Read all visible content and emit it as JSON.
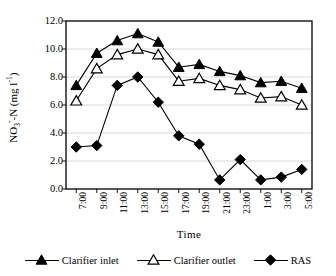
{
  "chart_data": {
    "type": "line",
    "title": "",
    "xlabel": "Time",
    "ylabel": "NO3--N (mg l-1)",
    "ylabel_parts": {
      "prefix": "NO",
      "sub": "3",
      "sup_minus": "-",
      "mid": "-N (mg l",
      "sup": "-1",
      "suffix": ")"
    },
    "categories": [
      "7:00",
      "9:00",
      "11:00",
      "13:00",
      "15:00",
      "17:00",
      "19:00",
      "21:00",
      "23:00",
      "1:00",
      "3:00",
      "5:00"
    ],
    "ylim": [
      0.0,
      12.0
    ],
    "yticks": [
      "12.0",
      "10.0",
      "8.0",
      "6.0",
      "4.0",
      "2.0",
      "0.0"
    ],
    "ytick_values": [
      12.0,
      10.0,
      8.0,
      6.0,
      4.0,
      2.0,
      0.0
    ],
    "grid": "horizontal",
    "legend_position": "bottom",
    "series": [
      {
        "name": "Clarifier inlet",
        "marker": "filled-triangle",
        "color": "#000000",
        "values": [
          7.4,
          9.7,
          10.6,
          11.1,
          10.5,
          8.7,
          8.9,
          8.4,
          8.1,
          7.6,
          7.7,
          7.2
        ]
      },
      {
        "name": "Clarifier outlet",
        "marker": "open-triangle",
        "color": "#000000",
        "values": [
          6.3,
          8.6,
          9.6,
          10.0,
          9.6,
          7.7,
          7.9,
          7.4,
          7.1,
          6.5,
          6.6,
          6.0
        ]
      },
      {
        "name": "RAS",
        "marker": "filled-diamond",
        "color": "#000000",
        "values": [
          3.0,
          3.1,
          7.4,
          8.0,
          6.2,
          3.8,
          3.2,
          0.65,
          2.1,
          0.65,
          0.85,
          1.4
        ]
      }
    ]
  },
  "legend": {
    "items": [
      {
        "label": "Clarifier inlet",
        "marker": "filled-triangle"
      },
      {
        "label": "Clarifier outlet",
        "marker": "open-triangle"
      },
      {
        "label": "RAS",
        "marker": "filled-diamond"
      }
    ]
  }
}
